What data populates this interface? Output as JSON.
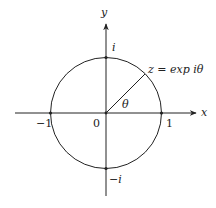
{
  "diagram": {
    "axes": {
      "x_label": "x",
      "y_label": "y"
    },
    "points": {
      "origin": "0",
      "plus_one": "1",
      "minus_one": "−1",
      "plus_i": "i",
      "minus_i": "−i"
    },
    "annotations": {
      "z_label": "z = exp iθ",
      "angle_label": "θ"
    },
    "colors": {
      "stroke": "#222222",
      "background": "#ffffff"
    }
  }
}
